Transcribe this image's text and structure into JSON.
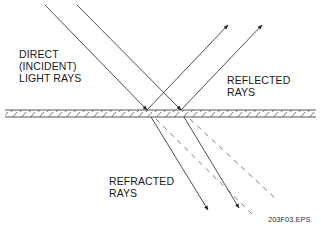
{
  "labels": {
    "incident_line1": "DIRECT",
    "incident_line2": "(INCIDENT)",
    "incident_line3": "LIGHT RAYS",
    "reflected_line1": "REFLECTED",
    "reflected_line2": "RAYS",
    "refracted_line1": "REFRACTED",
    "refracted_line2": "RAYS"
  },
  "caption": "203F03.EPS",
  "colors": {
    "line": "#222222",
    "text": "#1a1a1a",
    "background": "#ffffff"
  }
}
